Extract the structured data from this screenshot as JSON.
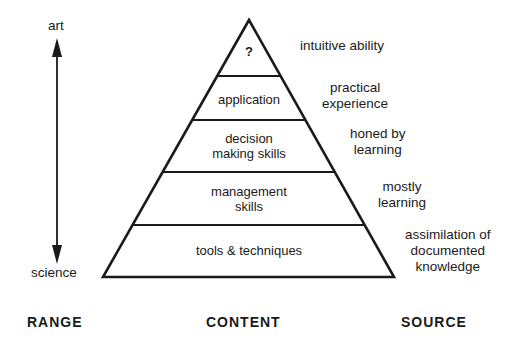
{
  "range": {
    "top_label": "art",
    "bottom_label": "science",
    "heading": "RANGE"
  },
  "content": {
    "heading": "CONTENT",
    "levels": [
      {
        "label": "?"
      },
      {
        "label": "application"
      },
      {
        "label_line1": "decision",
        "label_line2": "making skills"
      },
      {
        "label_line1": "management",
        "label_line2": "skills"
      },
      {
        "label": "tools & techniques"
      }
    ]
  },
  "source": {
    "heading": "SOURCE",
    "items": [
      {
        "line1": "intuitive ability"
      },
      {
        "line1": "practical",
        "line2": "experience"
      },
      {
        "line1": "honed by",
        "line2": "learning"
      },
      {
        "line1": "mostly",
        "line2": "learning"
      },
      {
        "line1": "assimilation of",
        "line2": "documented",
        "line3": "knowledge"
      }
    ]
  }
}
